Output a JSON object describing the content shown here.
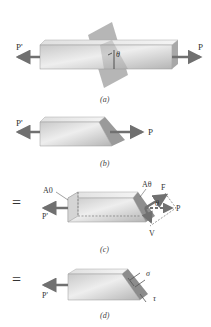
{
  "figure": {
    "panels": [
      {
        "id": "a",
        "caption": "(a)",
        "labels": {
          "left_force": "P'",
          "right_force": "P",
          "angle": "θ"
        },
        "description": "Prismatic bar under axial load with an oblique section plane at angle θ"
      },
      {
        "id": "b",
        "caption": "(b)",
        "labels": {
          "left_force": "P'",
          "right_force": "P"
        },
        "description": "Bar cut along the oblique section"
      },
      {
        "id": "c",
        "caption": "(c)",
        "labels": {
          "left_force": "P'",
          "area_normal": "A0",
          "area_oblique": "Aθ",
          "normal_force": "F",
          "shear_force": "V",
          "resultant": "P",
          "angle": "θ"
        },
        "prefix": "="
      },
      {
        "id": "d",
        "caption": "(d)",
        "labels": {
          "left_force": "P'",
          "normal_stress": "σ",
          "shear_stress": "τ"
        },
        "prefix": "="
      }
    ],
    "colors": {
      "bar_light": "#e8e8e8",
      "bar_mid": "#c8c8c8",
      "bar_dark": "#9a9a9a",
      "arrow": "#707070",
      "text": "#333333"
    }
  }
}
